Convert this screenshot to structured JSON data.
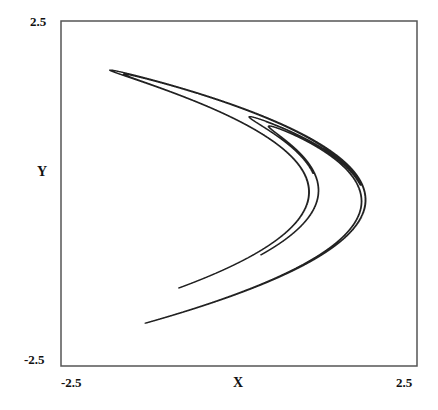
{
  "chart_data": {
    "type": "scatter",
    "title": "",
    "xlabel": "X",
    "ylabel": "Y",
    "xlim": [
      -2.5,
      2.5
    ],
    "ylim": [
      -2.5,
      2.5
    ],
    "x_ticks": [
      "-2.5",
      "2.5"
    ],
    "y_ticks": [
      "2.5",
      "-2.5"
    ],
    "grid": false,
    "legend": null,
    "series": [
      {
        "name": "attractor",
        "key_points": [
          {
            "x": -1.81,
            "y": 1.79
          },
          {
            "x": 0.3,
            "y": 0.9
          },
          {
            "x": 1.75,
            "y": -0.1
          },
          {
            "x": 0.9,
            "y": -1.0
          },
          {
            "x": -0.85,
            "y": -1.3
          },
          {
            "x": -1.3,
            "y": -1.95
          }
        ]
      }
    ]
  },
  "axes": {
    "x_min_label": "-2.5",
    "x_max_label": "2.5",
    "y_max_label": "2.5",
    "y_min_label": "-2.5",
    "x_title": "X",
    "y_title": "Y"
  },
  "style": {
    "line_color": "#222222",
    "frame_color": "#555555"
  }
}
